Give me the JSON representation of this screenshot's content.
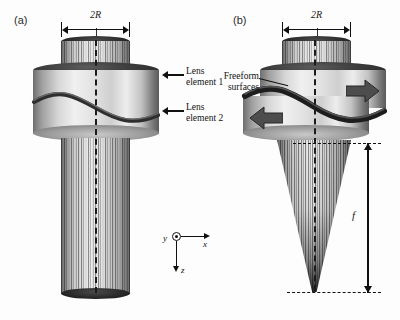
{
  "figure": {
    "caption_absent": true,
    "background_color": "#fdfdfd",
    "ink_color": "#111111"
  },
  "panels": [
    {
      "id": "a",
      "letter": "(a)",
      "state": "neutral / zero optical power",
      "aperture_label": "2R",
      "output_beam": "collimated",
      "callouts": [
        {
          "name": "lens-element-1",
          "text": "Lens\nelement 1"
        },
        {
          "name": "lens-element-2",
          "text": "Lens\nelement 2"
        }
      ]
    },
    {
      "id": "b",
      "letter": "(b)",
      "state": "laterally displaced / focusing",
      "aperture_label": "2R",
      "output_beam": "converging",
      "focal_length_label": "f",
      "callouts": [
        {
          "name": "freeform-surfaces",
          "text": "Freeform\nsurfaces"
        }
      ],
      "shift_arrows": [
        {
          "name": "upper-element-shift-right",
          "direction": "right"
        },
        {
          "name": "lower-element-shift-left",
          "direction": "left"
        }
      ]
    }
  ],
  "axes": {
    "name": "coordinate-gizmo",
    "y_label": "y",
    "x_label": "x",
    "z_label": "z",
    "y_orientation": "out-of-page",
    "x_orientation": "right",
    "z_orientation": "down"
  }
}
